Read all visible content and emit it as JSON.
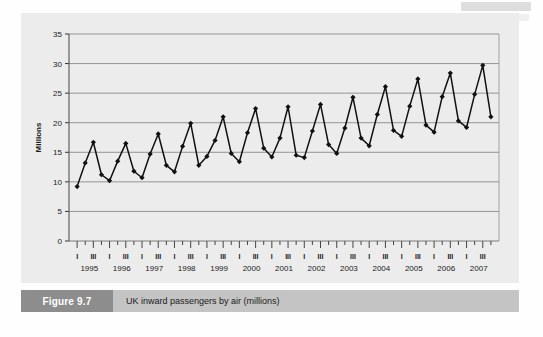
{
  "figure": {
    "number_label": "Figure 9.7",
    "caption": "UK inward passengers by air (millions)"
  },
  "chart_data": {
    "type": "line",
    "title": "UK inward passengers by air (millions)",
    "xlabel": "",
    "ylabel": "Millions",
    "ylim": [
      0,
      35
    ],
    "yticks": [
      0,
      5,
      10,
      15,
      20,
      25,
      30,
      35
    ],
    "ytick_labels": [
      "0",
      "5",
      "10",
      "15",
      "20",
      "25",
      "30",
      "35"
    ],
    "grid": true,
    "legend": "none",
    "marker": "diamond",
    "line_color": "#111111",
    "marker_color": "#111111",
    "plot_background": "#ececec",
    "years": [
      "1995",
      "1996",
      "1997",
      "1998",
      "1999",
      "2000",
      "2001",
      "2002",
      "2003",
      "2004",
      "2005",
      "2006",
      "2007"
    ],
    "quarter_tick_labels": [
      "I",
      "",
      "III",
      ""
    ],
    "x": [
      "1995 I",
      "1995 II",
      "1995 III",
      "1995 IV",
      "1996 I",
      "1996 II",
      "1996 III",
      "1996 IV",
      "1997 I",
      "1997 II",
      "1997 III",
      "1997 IV",
      "1998 I",
      "1998 II",
      "1998 III",
      "1998 IV",
      "1999 I",
      "1999 II",
      "1999 III",
      "1999 IV",
      "2000 I",
      "2000 II",
      "2000 III",
      "2000 IV",
      "2001 I",
      "2001 II",
      "2001 III",
      "2001 IV",
      "2002 I",
      "2002 II",
      "2002 III",
      "2002 IV",
      "2003 I",
      "2003 II",
      "2003 III",
      "2003 IV",
      "2004 I",
      "2004 II",
      "2004 III",
      "2004 IV",
      "2005 I",
      "2005 II",
      "2005 III",
      "2005 IV",
      "2006 I",
      "2006 II",
      "2006 III",
      "2006 IV",
      "2007 I",
      "2007 II",
      "2007 III",
      "2007 IV"
    ],
    "values": [
      9.2,
      13.2,
      16.7,
      11.2,
      10.2,
      13.5,
      16.5,
      11.8,
      10.7,
      14.7,
      18.1,
      12.8,
      11.7,
      16.0,
      19.9,
      12.8,
      14.3,
      17.0,
      21.0,
      14.8,
      13.4,
      18.3,
      22.4,
      15.7,
      14.2,
      17.4,
      22.7,
      14.5,
      14.1,
      18.6,
      23.1,
      16.3,
      14.8,
      19.1,
      24.3,
      17.4,
      16.1,
      21.4,
      26.1,
      18.7,
      17.7,
      22.8,
      27.4,
      19.6,
      18.4,
      24.4,
      28.4,
      20.3,
      19.2,
      24.8,
      29.7,
      21.0
    ]
  }
}
